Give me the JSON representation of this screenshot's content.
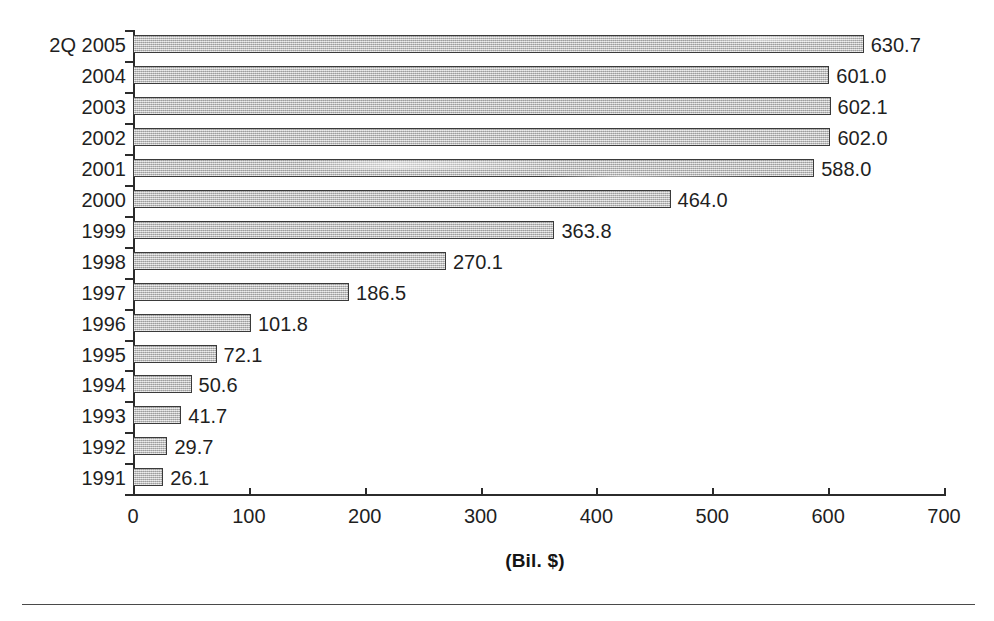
{
  "chart_data": {
    "type": "bar",
    "orientation": "horizontal",
    "title": "",
    "subtitle": "",
    "xlabel": "(Bil. $)",
    "ylabel": "",
    "xlim": [
      0,
      700
    ],
    "xticks": [
      0,
      100,
      200,
      300,
      400,
      500,
      600,
      700
    ],
    "grid": false,
    "legend": null,
    "categories": [
      "2Q 2005",
      "2004",
      "2003",
      "2002",
      "2001",
      "2000",
      "1999",
      "1998",
      "1997",
      "1996",
      "1995",
      "1994",
      "1993",
      "1992",
      "1991"
    ],
    "values": [
      630.7,
      601.0,
      602.1,
      602.0,
      588.0,
      464.0,
      363.8,
      270.1,
      186.5,
      101.8,
      72.1,
      50.6,
      41.7,
      29.7,
      26.1
    ],
    "value_labels": [
      "630.7",
      "601.0",
      "602.1",
      "602.0",
      "588.0",
      "464.0",
      "363.8",
      "270.1",
      "186.5",
      "101.8",
      "72.1",
      "50.6",
      "41.7",
      "29.7",
      "26.1"
    ],
    "bar_fill_color": "#bdbdbd",
    "bar_border_color": "#3a3a3a",
    "axis_color": "#2b2b2b",
    "text_color": "#1f1f1f",
    "background_color": "#ffffff"
  },
  "axis": {
    "x_tick_labels": [
      "0",
      "100",
      "200",
      "300",
      "400",
      "500",
      "600",
      "700"
    ],
    "x_axis_title": "(Bil. $)"
  }
}
